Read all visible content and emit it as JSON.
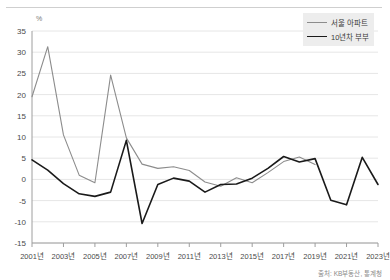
{
  "chart_data": {
    "type": "line",
    "title": "",
    "xlabel": "",
    "ylabel": "%",
    "unit_label": "%",
    "ylim": [
      -15,
      35
    ],
    "ytick_values": [
      35,
      30,
      25,
      20,
      15,
      10,
      5,
      0,
      -5,
      -10,
      -15
    ],
    "ytick_labels": [
      "35",
      "30",
      "25",
      "20",
      "15",
      "10",
      "5",
      "0",
      "-5",
      "-10",
      "-15"
    ],
    "grid": true,
    "legend_position": "top-right",
    "x": [
      2001,
      2002,
      2003,
      2004,
      2005,
      2006,
      2007,
      2008,
      2009,
      2010,
      2011,
      2012,
      2013,
      2014,
      2015,
      2016,
      2017,
      2018,
      2019,
      2020,
      2021,
      2022,
      2023
    ],
    "xtick_labels": [
      "2001년",
      "2003년",
      "2005년",
      "2007년",
      "2009년",
      "2011년",
      "2013년",
      "2015년",
      "2017년",
      "2019년",
      "2021년",
      "2023년"
    ],
    "xtick_values": [
      2001,
      2003,
      2005,
      2007,
      2009,
      2011,
      2013,
      2015,
      2017,
      2019,
      2021,
      2023
    ],
    "series": [
      {
        "name": "서울 아파트",
        "color": "#8c8c8c",
        "width": 1.1,
        "values": [
          19.5,
          31.3,
          10.5,
          1.0,
          -0.8,
          24.6,
          9.8,
          3.6,
          2.6,
          3.0,
          2.1,
          -0.6,
          -1.6,
          0.4,
          -0.8,
          1.6,
          4.2,
          5.3,
          3.5,
          null,
          null,
          null,
          null
        ]
      },
      {
        "name": "10년차 부부",
        "color": "#1a1a1a",
        "width": 1.6,
        "values": [
          4.6,
          2.2,
          -1.0,
          -3.4,
          -4.0,
          -3.0,
          9.2,
          -10.4,
          -1.2,
          0.3,
          -0.4,
          -3.0,
          -1.2,
          -1.1,
          0.3,
          2.6,
          5.4,
          4.1,
          4.9,
          -4.9,
          -6.0,
          5.2,
          -1.2
        ]
      }
    ],
    "source_note": "출처: KB부동산, 통계청"
  },
  "legend": {
    "items": [
      {
        "label": "서울 아파트"
      },
      {
        "label": "10년차 부부"
      }
    ]
  }
}
